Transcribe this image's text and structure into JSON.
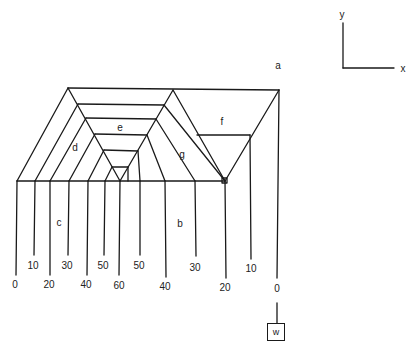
{
  "diagram": {
    "region_labels": {
      "a": "a",
      "b": "b",
      "c": "c",
      "d": "d",
      "e": "e",
      "f": "f",
      "g": "g"
    },
    "axes": {
      "y": "y",
      "x": "x"
    },
    "weight_label": "w",
    "left_values": [
      "0",
      "10",
      "20",
      "30",
      "40",
      "50",
      "60"
    ],
    "right_values": [
      "50",
      "40",
      "30",
      "20",
      "10",
      "0"
    ],
    "stroke_color": "#1a1a1a"
  }
}
